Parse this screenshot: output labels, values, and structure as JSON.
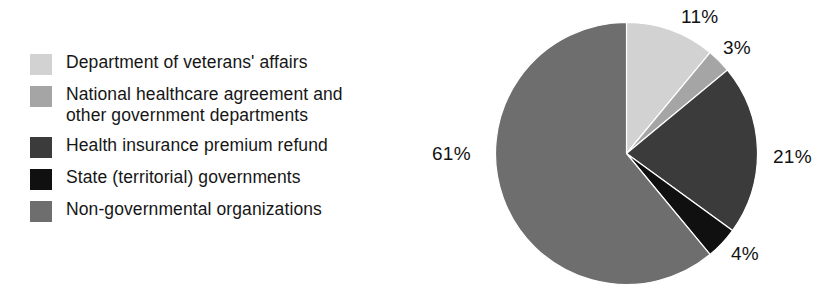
{
  "chart_data": {
    "type": "pie",
    "title": "",
    "subtitle": "",
    "xlabel": "",
    "ylabel": "",
    "units": "percent",
    "start_angle_deg": 0,
    "direction": "clockwise",
    "grid": false,
    "legend_position": "left",
    "categories": [
      "Department of veterans' affairs",
      "National healthcare agreement and\nother government departments",
      "Health insurance premium refund",
      "State (territorial) governments",
      "Non-governmental organizations"
    ],
    "values": [
      11,
      3,
      21,
      4,
      61
    ],
    "value_labels": [
      "11%",
      "3%",
      "21%",
      "4%",
      "61%"
    ],
    "colors": [
      "#d2d2d2",
      "#a5a5a5",
      "#3b3b3b",
      "#101010",
      "#6e6e6e"
    ],
    "total": 100
  },
  "legend": {
    "items": [
      {
        "label": "Department of veterans' affairs",
        "color": "#d2d2d2"
      },
      {
        "label": "National healthcare agreement and\nother government departments",
        "color": "#a5a5a5"
      },
      {
        "label": "Health insurance premium refund",
        "color": "#3b3b3b"
      },
      {
        "label": "State (territorial) governments",
        "color": "#101010"
      },
      {
        "label": "Non-governmental organizations",
        "color": "#6e6e6e"
      }
    ]
  }
}
